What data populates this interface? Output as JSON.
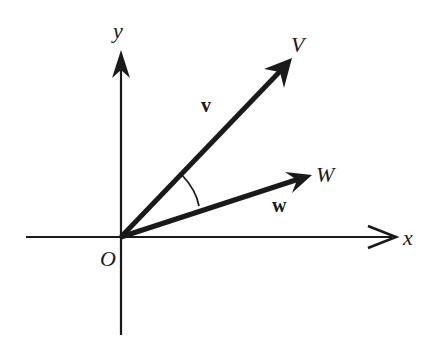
{
  "diagram": {
    "axes": {
      "x_label": "x",
      "y_label": "y",
      "origin_label": "O"
    },
    "vectors": [
      {
        "name": "v",
        "endpoint_label": "V",
        "direction": "upper-right, steep"
      },
      {
        "name": "w",
        "endpoint_label": "W",
        "direction": "upper-right, shallow"
      }
    ],
    "angle_arc": "angle between v and w",
    "colors": {
      "stroke": "#1a1a1a",
      "background": "#ffffff"
    }
  }
}
